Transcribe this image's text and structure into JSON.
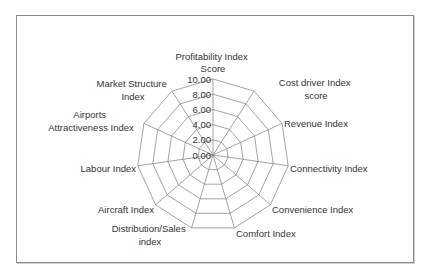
{
  "chart_data": {
    "type": "radar",
    "title": "",
    "categories": [
      "Profitability Index Score",
      "Cost driver Index score",
      "Revenue Index",
      "Connectivity Index",
      "Convenience Index",
      "Comfort Index",
      "Distribution/Sales index",
      "Aircraft Index",
      "Labour  Index",
      "Airports Attractiveness Index",
      "Market Structure Index"
    ],
    "series": [],
    "radial_ticks": [
      "0.00",
      "2.00",
      "4.00",
      "6.00",
      "8.00",
      "10.00"
    ],
    "rlim": [
      0,
      10
    ],
    "grid": true,
    "legend": "none",
    "grid_color": "#8c8c8c",
    "text_color": "#333333"
  },
  "labels": {
    "profitability": [
      "Profitability Index",
      "Score"
    ],
    "cost_driver": [
      "Cost driver Index",
      "score"
    ],
    "revenue": [
      "Revenue Index"
    ],
    "connectivity": [
      "Connectivity Index"
    ],
    "convenience": [
      "Convenience Index"
    ],
    "comfort": [
      "Comfort Index"
    ],
    "distribution": [
      "Distribution/Sales",
      "index"
    ],
    "aircraft": [
      "Aircraft Index"
    ],
    "labour": [
      "Labour  Index"
    ],
    "airports": [
      "Airports",
      "Attractiveness Index"
    ],
    "market": [
      "Market Structure",
      "Index"
    ]
  }
}
